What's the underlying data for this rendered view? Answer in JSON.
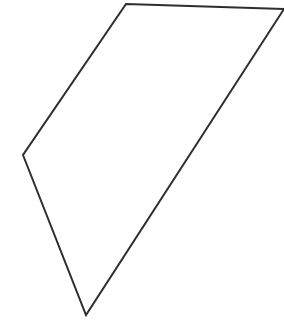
{
  "canvas": {
    "width": 284,
    "height": 327,
    "background_color": "#ffffff",
    "title": "Polygon Line Drawing"
  },
  "figure": {
    "name": "irregular-quadrilateral",
    "stroke_color": "#2e2e2e",
    "fill_color": "none",
    "stroke_width": 2,
    "clipped_at_right_edge": true,
    "vertices": [
      {
        "name": "top-apex",
        "x": 126,
        "y": 4
      },
      {
        "name": "top-right-clipped",
        "x": 284,
        "y": 9
      },
      {
        "name": "bottom-point",
        "x": 86,
        "y": 315
      },
      {
        "name": "left-point",
        "x": 23,
        "y": 155
      }
    ],
    "points_attr": "126,4 284,9 86,315 23,155",
    "edges": [
      {
        "name": "top-edge",
        "from": "top-apex",
        "to": "top-right-clipped"
      },
      {
        "name": "right-diagonal-edge",
        "from": "top-right-clipped",
        "to": "bottom-point"
      },
      {
        "name": "lower-left-edge",
        "from": "bottom-point",
        "to": "left-point"
      },
      {
        "name": "upper-left-edge",
        "from": "left-point",
        "to": "top-apex"
      }
    ]
  }
}
